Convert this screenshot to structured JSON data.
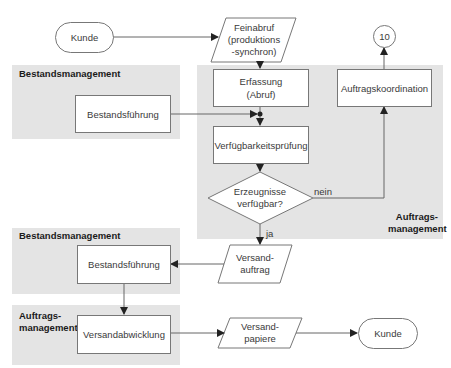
{
  "diagram": {
    "type": "flowchart",
    "colors": {
      "lane_bg": "#e4e4e4",
      "node_border": "#777777",
      "node_fill": "#ffffff",
      "arrow": "#555555",
      "text": "#3a3a3a"
    },
    "lanes": [
      {
        "id": "lane-bestand-1",
        "label": "Bestandsmanagement"
      },
      {
        "id": "lane-auftrag-1",
        "label_line1": "Auftrags-",
        "label_line2": "management"
      },
      {
        "id": "lane-bestand-2",
        "label": "Bestandsmanagement"
      },
      {
        "id": "lane-auftrag-2",
        "label_line1": "Auftrags-",
        "label_line2": "management"
      }
    ],
    "nodes": {
      "kunde_top": {
        "shape": "terminal",
        "label": "Kunde"
      },
      "feinabruf": {
        "shape": "parallelogram",
        "line1": "Feinabruf",
        "line2": "(produktions",
        "line3": "-synchron)"
      },
      "connector": {
        "shape": "circle",
        "label": "10"
      },
      "erfassung": {
        "shape": "process",
        "line1": "Erfassung",
        "line2": "(Abruf)"
      },
      "auftragskoordination": {
        "shape": "process",
        "label": "Auftragskoordination"
      },
      "bestandsfuehrung_1": {
        "shape": "process",
        "label": "Bestandsführung"
      },
      "verfuegbarkeitspruefung": {
        "shape": "process",
        "label": "Verfügbarkeitsprüfung"
      },
      "decision": {
        "shape": "diamond",
        "line1": "Erzeugnisse",
        "line2": "verfügbar?"
      },
      "bestandsfuehrung_2": {
        "shape": "process",
        "label": "Bestandsführung"
      },
      "versandauftrag": {
        "shape": "parallelogram",
        "line1": "Versand-",
        "line2": "auftrag"
      },
      "versandabwicklung": {
        "shape": "process",
        "label": "Versandabwicklung"
      },
      "versandpapiere": {
        "shape": "parallelogram",
        "line1": "Versand-",
        "line2": "papiere"
      },
      "kunde_bottom": {
        "shape": "terminal",
        "label": "Kunde"
      }
    },
    "edge_labels": {
      "no": "nein",
      "yes": "ja"
    },
    "edges": [
      {
        "from": "kunde_top",
        "to": "feinabruf"
      },
      {
        "from": "feinabruf",
        "to": "erfassung"
      },
      {
        "from": "erfassung",
        "to": "verfuegbarkeitspruefung"
      },
      {
        "from": "bestandsfuehrung_1",
        "to": "verfuegbarkeitspruefung"
      },
      {
        "from": "verfuegbarkeitspruefung",
        "to": "decision"
      },
      {
        "from": "decision",
        "to": "auftragskoordination",
        "label": "nein"
      },
      {
        "from": "auftragskoordination",
        "to": "connector"
      },
      {
        "from": "decision",
        "to": "versandauftrag",
        "label": "ja"
      },
      {
        "from": "versandauftrag",
        "to": "bestandsfuehrung_2"
      },
      {
        "from": "bestandsfuehrung_2",
        "to": "versandabwicklung"
      },
      {
        "from": "versandabwicklung",
        "to": "versandpapiere"
      },
      {
        "from": "versandpapiere",
        "to": "kunde_bottom"
      }
    ]
  }
}
